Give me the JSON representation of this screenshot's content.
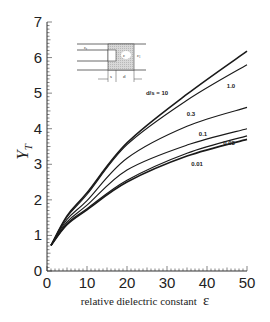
{
  "chart_data": {
    "type": "line",
    "title": "",
    "xlabel": "relative dielectric constant",
    "xlabel_symbol": "ε",
    "ylabel": "Y",
    "ylabel_subscript": "T",
    "xlim": [
      0,
      50
    ],
    "ylim": [
      0,
      7
    ],
    "xticks": [
      0,
      10,
      20,
      30,
      40,
      50
    ],
    "yticks": [
      0,
      1,
      2,
      3,
      4,
      5,
      6,
      7
    ],
    "grid": false,
    "x": [
      1,
      5,
      10,
      20,
      35,
      50
    ],
    "series": [
      {
        "name": "d/s = 10",
        "label": "d/s = 10",
        "values": [
          0.72,
          1.55,
          2.2,
          3.6,
          4.97,
          6.18
        ]
      },
      {
        "name": "1.0",
        "label": "1.0",
        "values": [
          0.72,
          1.52,
          2.15,
          3.55,
          4.8,
          5.8
        ]
      },
      {
        "name": "0.3",
        "label": "0.3",
        "values": [
          0.72,
          1.45,
          1.98,
          3.17,
          4.07,
          4.6
        ]
      },
      {
        "name": "0.1",
        "label": "0.1",
        "values": [
          0.72,
          1.38,
          1.85,
          2.84,
          3.54,
          4.0
        ]
      },
      {
        "name": "0.03",
        "label": "0.03",
        "values": [
          0.72,
          1.33,
          1.75,
          2.55,
          3.31,
          3.8
        ]
      },
      {
        "name": "0.01",
        "label": "0.01",
        "values": [
          0.72,
          1.3,
          1.72,
          2.5,
          3.23,
          3.7
        ]
      }
    ],
    "inset": {
      "description": "cross-section schematic",
      "labels": {
        "eps_r": "ε_r",
        "eps": "ε",
        "eps_1": "ε_1",
        "s": "s",
        "d": "d"
      }
    }
  }
}
